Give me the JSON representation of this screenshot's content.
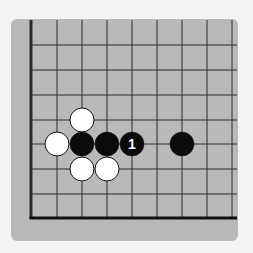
{
  "board": {
    "panel_color": "#b9b9b7",
    "line_color": "#2a2a2a",
    "columns_x": [
      31,
      57,
      82,
      107,
      132,
      157,
      182,
      207,
      232
    ],
    "rows_y": [
      45,
      70,
      95,
      120,
      144,
      169,
      194
    ],
    "edge_left_x": 31,
    "edge_bottom_y": 218,
    "top_y": 20,
    "right_x": 237
  },
  "stones": [
    {
      "color": "white",
      "x": 82,
      "y": 120,
      "label": ""
    },
    {
      "color": "white",
      "x": 57,
      "y": 144,
      "label": ""
    },
    {
      "color": "black",
      "x": 82,
      "y": 144,
      "label": ""
    },
    {
      "color": "black",
      "x": 107,
      "y": 144,
      "label": ""
    },
    {
      "color": "black",
      "x": 132,
      "y": 144,
      "label": "1"
    },
    {
      "color": "black",
      "x": 182,
      "y": 144,
      "label": ""
    },
    {
      "color": "white",
      "x": 82,
      "y": 169,
      "label": ""
    },
    {
      "color": "white",
      "x": 107,
      "y": 169,
      "label": ""
    }
  ],
  "stone_radius": 12
}
